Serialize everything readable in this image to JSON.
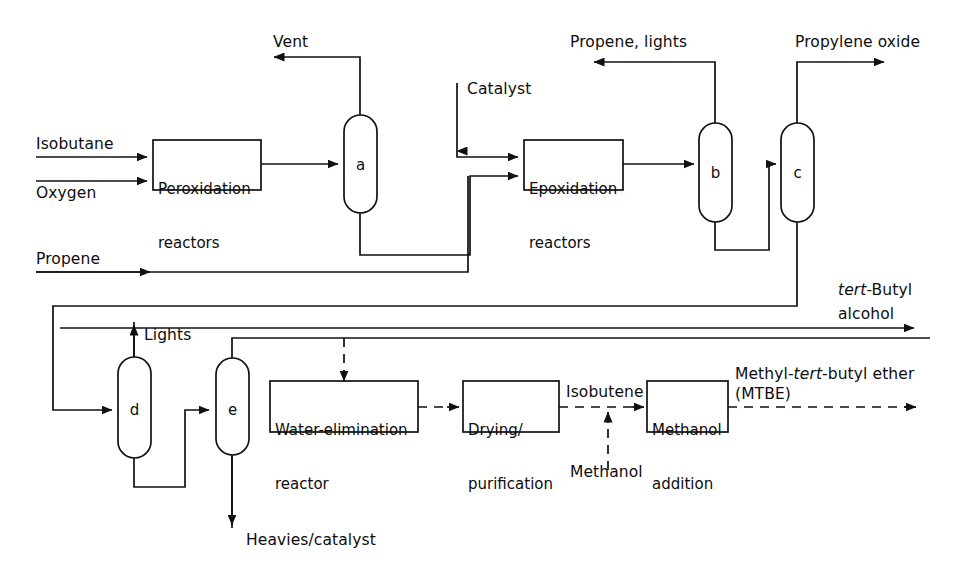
{
  "diagram": {
    "canvas": {
      "width": 967,
      "height": 586
    },
    "line_color": "#111111",
    "background": "#ffffff"
  },
  "feeds": {
    "isobutane": "Isobutane",
    "oxygen": "Oxygen",
    "propene": "Propene",
    "catalyst": "Catalyst",
    "methanol": "Methanol"
  },
  "products": {
    "vent": "Vent",
    "propene_lights": "Propene, lights",
    "propylene_oxide": "Propylene oxide",
    "tba_line1": "tert-Butyl",
    "tba_line1_italic": "tert",
    "tba_line1_rest": "-Butyl",
    "tba_line2": "alcohol",
    "lights": "Lights",
    "heavies_catalyst": "Heavies/catalyst",
    "isobutene": "Isobutene",
    "mtbe_line1_a": "Methyl-",
    "mtbe_line1_italic": "tert",
    "mtbe_line1_b": "-butyl ether",
    "mtbe_line2": "(MTBE)"
  },
  "units": {
    "peroxidation": {
      "line1": "Peroxidation",
      "line2": "reactors"
    },
    "epoxidation": {
      "line1": "Epoxidation",
      "line2": "reactors"
    },
    "water_elimination": {
      "line1": "Water-elimination",
      "line2": "reactor"
    },
    "drying": {
      "line1": "Drying/",
      "line2": "purification"
    },
    "methanol_addition": {
      "line1": "Methanol",
      "line2": "addition"
    }
  },
  "columns": {
    "a": "a",
    "b": "b",
    "c": "c",
    "d": "d",
    "e": "e"
  }
}
